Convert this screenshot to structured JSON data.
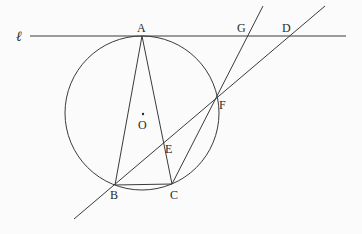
{
  "diagram": {
    "type": "geometry",
    "labels": {
      "line_l": "ℓ",
      "A": "A",
      "B": "B",
      "C": "C",
      "D": "D",
      "E": "E",
      "F": "F",
      "G": "G",
      "O": "O"
    },
    "segments": [
      "AB",
      "AC",
      "BC",
      "CF",
      "BF",
      "FD",
      "FG"
    ],
    "tangent_line": "ℓ tangent to circle O at A",
    "points_on_circle": [
      "A",
      "B",
      "C",
      "F"
    ],
    "points_on_line_l": [
      "A",
      "G",
      "D"
    ],
    "intersection_E": "AC ∩ BF"
  }
}
